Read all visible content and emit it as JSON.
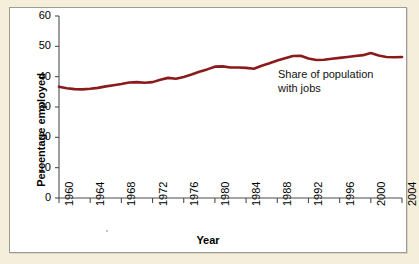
{
  "figure": {
    "panel_background": "#ffffff",
    "outer_background": "#f4eedb",
    "border_color": "#9b9b93",
    "line_color": "#8B1A1A",
    "axis_color": "#4d4d4d",
    "text_color": "#000000"
  },
  "annotation": {
    "text": "Share of population\nwith jobs"
  },
  "chart_data": {
    "type": "line",
    "title": "",
    "xlabel": "Year",
    "ylabel": "Percentage employed",
    "xlim": [
      1960,
      2004
    ],
    "ylim": [
      0,
      60
    ],
    "yticks": [
      0,
      10,
      20,
      30,
      40,
      50,
      60
    ],
    "xticks": [
      1960,
      1964,
      1968,
      1972,
      1976,
      1980,
      1984,
      1988,
      1992,
      1996,
      2000,
      2004
    ],
    "grid": false,
    "legend": "none",
    "annotations": [
      {
        "text": "Share of population with jobs",
        "x": 1989,
        "y": 30
      }
    ],
    "series": [
      {
        "name": "Share of population with jobs",
        "color": "#8B1A1A",
        "x": [
          1960,
          1961,
          1962,
          1963,
          1964,
          1965,
          1966,
          1967,
          1968,
          1969,
          1970,
          1971,
          1972,
          1973,
          1974,
          1975,
          1976,
          1977,
          1978,
          1979,
          1980,
          1981,
          1982,
          1983,
          1984,
          1985,
          1986,
          1987,
          1988,
          1989,
          1990,
          1991,
          1992,
          1993,
          1994,
          1995,
          1996,
          1997,
          1998,
          1999,
          2000,
          2001,
          2002,
          2003,
          2004
        ],
        "values": [
          36.7,
          36.2,
          35.9,
          35.8,
          36.0,
          36.3,
          36.8,
          37.2,
          37.6,
          38.1,
          38.2,
          38.0,
          38.2,
          39.0,
          39.6,
          39.3,
          39.9,
          40.7,
          41.6,
          42.4,
          43.3,
          43.4,
          43.0,
          43.0,
          42.9,
          42.6,
          43.6,
          44.4,
          45.3,
          46.1,
          46.8,
          46.9,
          46.0,
          45.5,
          45.6,
          45.9,
          46.2,
          46.5,
          46.8,
          47.1,
          47.8,
          47.0,
          46.5,
          46.4,
          46.5
        ]
      }
    ]
  }
}
